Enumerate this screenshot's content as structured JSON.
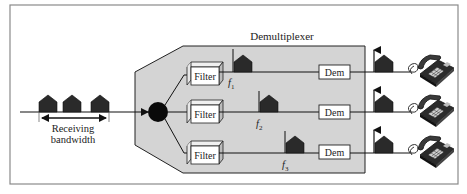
{
  "title": "Demultiplexer",
  "input": {
    "label_line1": "Receiving",
    "label_line2": "bandwidth"
  },
  "channels": [
    {
      "filter_label": "Filter",
      "freq_label": "f",
      "freq_sub": "1",
      "dem_label": "Dem"
    },
    {
      "filter_label": "Filter",
      "freq_label": "f",
      "freq_sub": "2",
      "dem_label": "Dem"
    },
    {
      "filter_label": "Filter",
      "freq_label": "f",
      "freq_sub": "3",
      "dem_label": "Dem"
    }
  ],
  "colors": {
    "frame": "#8a8a8a",
    "panel": "#d4d4d4",
    "ink": "#1a1a1a",
    "signal": "#2a2a2a",
    "box_fill": "#ffffff"
  }
}
